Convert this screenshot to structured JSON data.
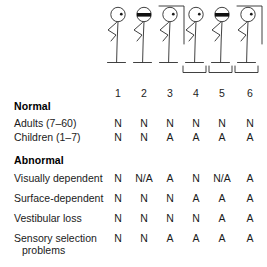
{
  "diagram": {
    "ink_color": "#222222"
  },
  "conditions": {
    "numbers": [
      "1",
      "2",
      "3",
      "4",
      "5",
      "6"
    ],
    "items": [
      {
        "number": "1",
        "eyes": "open",
        "surround": "none",
        "surface": "firm",
        "icon": "stick-figure-eyes-open-firm-surface"
      },
      {
        "number": "2",
        "eyes": "blindfolded",
        "surround": "none",
        "surface": "firm",
        "icon": "stick-figure-blindfolded-firm-surface"
      },
      {
        "number": "3",
        "eyes": "open",
        "surround": "visual-surround",
        "surface": "firm",
        "icon": "stick-figure-visual-surround-firm-surface"
      },
      {
        "number": "4",
        "eyes": "open",
        "surround": "none",
        "surface": "sway-referenced-platform",
        "icon": "stick-figure-eyes-open-moving-platform"
      },
      {
        "number": "5",
        "eyes": "blindfolded",
        "surround": "none",
        "surface": "sway-referenced-platform",
        "icon": "stick-figure-blindfolded-moving-platform"
      },
      {
        "number": "6",
        "eyes": "open",
        "surround": "visual-surround",
        "surface": "sway-referenced-platform",
        "icon": "stick-figure-visual-surround-moving-platform"
      }
    ]
  },
  "table": {
    "sections": [
      {
        "heading": "Normal",
        "rows": [
          {
            "label": "Adults (7–60)",
            "label_line2": "",
            "values": [
              "N",
              "N",
              "N",
              "N",
              "N",
              "N"
            ]
          },
          {
            "label": "Children (1–7)",
            "label_line2": "",
            "values": [
              "N",
              "N",
              "A",
              "A",
              "A",
              "A"
            ]
          }
        ]
      },
      {
        "heading": "Abnormal",
        "rows": [
          {
            "label": "Visually dependent",
            "label_line2": "",
            "values": [
              "N",
              "N/A",
              "A",
              "N",
              "N/A",
              "A"
            ]
          },
          {
            "label": "Surface-dependent",
            "label_line2": "",
            "values": [
              "N",
              "N",
              "N",
              "A",
              "A",
              "A"
            ]
          },
          {
            "label": "Vestibular loss",
            "label_line2": "",
            "values": [
              "N",
              "N",
              "N",
              "N",
              "A",
              "A"
            ]
          },
          {
            "label": "Sensory selection",
            "label_line2": "problems",
            "values": [
              "N",
              "N",
              "A",
              "A",
              "A",
              "A"
            ]
          }
        ]
      }
    ]
  }
}
